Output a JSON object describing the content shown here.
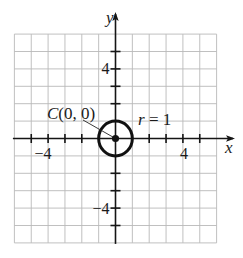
{
  "chart_data": {
    "type": "line",
    "title": "",
    "xlabel": "x",
    "ylabel": "y",
    "xlim": [
      -6,
      6
    ],
    "ylim": [
      -6,
      6
    ],
    "grid": true,
    "grid_step": 1,
    "axis_ticks": {
      "x": [
        -5,
        -4,
        -3,
        -2,
        2,
        3,
        4,
        5
      ],
      "y": [
        -5,
        -4,
        -3,
        -2,
        2,
        3,
        4,
        5
      ]
    },
    "tick_labels": {
      "x": [
        {
          "value": -4,
          "label": "−4"
        },
        {
          "value": 4,
          "label": "4"
        }
      ],
      "y": [
        {
          "value": 4,
          "label": "4"
        },
        {
          "value": -4,
          "label": "−4"
        }
      ]
    },
    "series": [
      {
        "name": "circle",
        "shape": "circle",
        "center": [
          0,
          0
        ],
        "radius": 1,
        "equation": "x^2 + y^2 = 1"
      }
    ],
    "points": [
      {
        "name": "C",
        "x": 0,
        "y": 0
      }
    ],
    "annotations": [
      {
        "text_parts": [
          "C",
          "(0, 0)"
        ],
        "text": "C(0, 0)",
        "points_to": [
          0,
          0
        ]
      },
      {
        "text_parts": [
          "r",
          " = 1"
        ],
        "text": "r = 1"
      }
    ],
    "colors": {
      "axes": "#151515",
      "grid": "#b9b9b9",
      "curve": "#111111"
    }
  }
}
